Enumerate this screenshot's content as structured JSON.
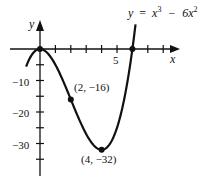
{
  "chart_data": {
    "type": "line",
    "equation_label": {
      "lhs": "y",
      "eq": "=",
      "term1": "x",
      "exp1": "3",
      "minus": "−",
      "term2": "6x",
      "exp2": "2"
    },
    "xlabel": "x",
    "ylabel": "y",
    "x_ticks": [
      1,
      2,
      3,
      4,
      5,
      6,
      7,
      8
    ],
    "x_tick_labels": [
      {
        "value": 5,
        "label": "5"
      }
    ],
    "y_ticks": [
      -5,
      -10,
      -15,
      -20,
      -25,
      -30,
      -35
    ],
    "y_tick_labels": [
      {
        "value": -10,
        "label": "−10"
      },
      {
        "value": -20,
        "label": "−20"
      },
      {
        "value": -30,
        "label": "−30"
      }
    ],
    "xlim": [
      -1,
      9
    ],
    "ylim": [
      -40,
      8
    ],
    "grid": false,
    "series": [
      {
        "name": "y = x^3 - 6x^2",
        "x_range": [
          -0.9,
          6.5
        ]
      }
    ],
    "points": [
      {
        "x": 0,
        "y": 0,
        "label": ""
      },
      {
        "x": 2,
        "y": -16,
        "label": "(2,  −16)"
      },
      {
        "x": 4,
        "y": -32,
        "label": "(4,  −32)"
      },
      {
        "x": 6,
        "y": 0,
        "label": ""
      }
    ]
  }
}
